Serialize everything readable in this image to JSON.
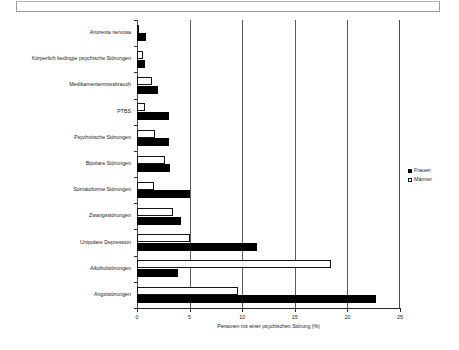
{
  "chart_data": {
    "type": "bar",
    "orientation": "horizontal",
    "title": "",
    "xlabel": "Personen mit einer psychischen Störung (%)",
    "ylabel": "",
    "xlim": [
      0,
      25
    ],
    "xticks": [
      "0",
      "5",
      "10",
      "15",
      "20",
      "25"
    ],
    "xtick_values": [
      0,
      5,
      10,
      15,
      20,
      25
    ],
    "grid": "vertical gridlines at 5, 10, 15, 20",
    "legend_position": "right",
    "categories": [
      "Anorexia nervosa",
      "Körperlich bedingte psychische Störungen",
      "Medikamentenmissbrauch",
      "PTBS",
      "Psychotische Störungen",
      "Bipolare Störungen",
      "Somatoforme Störungen",
      "Zwangsstörungen",
      "Unipolare Depression",
      "Alkoholstörungen",
      "Angststörungen"
    ],
    "series": [
      {
        "name": "Frauen",
        "color": "#000000",
        "fill": "solid",
        "values": [
          0.9,
          0.8,
          2.0,
          3.0,
          3.0,
          3.1,
          5.0,
          4.2,
          11.4,
          3.9,
          22.7
        ]
      },
      {
        "name": "Männer",
        "color": "#ffffff",
        "fill": "outline",
        "values": [
          0.1,
          0.6,
          1.4,
          0.8,
          1.7,
          2.7,
          1.6,
          3.4,
          5.0,
          18.4,
          9.6
        ]
      }
    ]
  },
  "legend": {
    "items": [
      {
        "label": "Frauen",
        "style": "filled"
      },
      {
        "label": "Männer",
        "style": "outline"
      }
    ]
  }
}
